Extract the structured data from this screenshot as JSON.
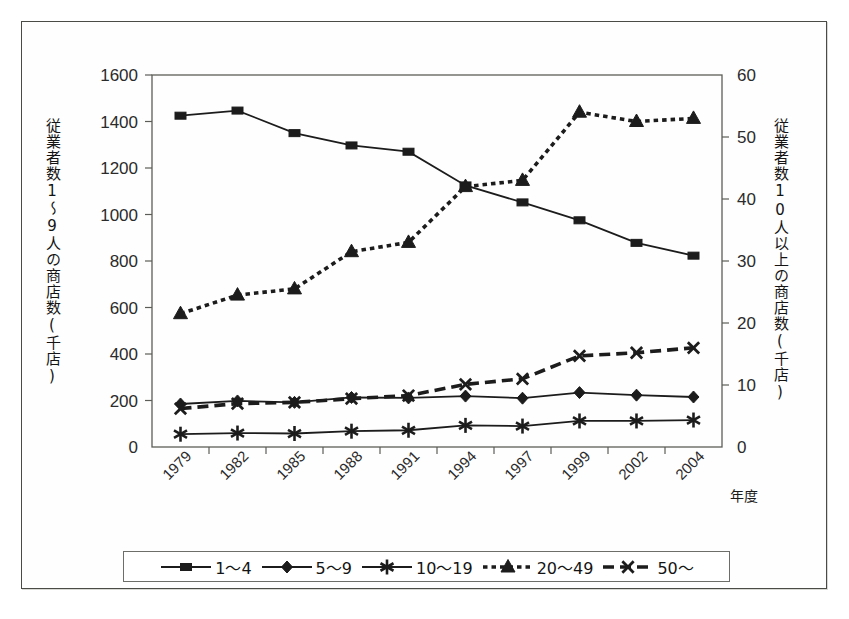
{
  "figure": {
    "left_axis_caption": "従業者数1〜9人の商店数(千店)",
    "right_axis_caption": "従業者数10人以上の商店数(千店)",
    "x_axis_unit_label": "年度"
  },
  "legend": {
    "items": [
      {
        "label": "1〜4",
        "marker": "square-marker",
        "dash": "solid"
      },
      {
        "label": "5〜9",
        "marker": "diamond-marker",
        "dash": "solid"
      },
      {
        "label": "10〜19",
        "marker": "asterisk-marker",
        "dash": "solid"
      },
      {
        "label": "20〜49",
        "marker": "triangle-marker",
        "dash": "dotted"
      },
      {
        "label": "50〜",
        "marker": "star-x-marker",
        "dash": "dashed"
      }
    ]
  },
  "chart_data": {
    "type": "line",
    "title": "",
    "xlabel": "年度",
    "ylabel": "従業者数1〜9人の商店数(千店)",
    "y2label": "従業者数10人以上の商店数(千店)",
    "categories": [
      "1979",
      "1982",
      "1985",
      "1988",
      "1991",
      "1994",
      "1997",
      "1999",
      "2002",
      "2004"
    ],
    "x_tick_labels": [
      "1979",
      "1982",
      "1985",
      "1988",
      "1991",
      "1994",
      "1997",
      "1999",
      "2002",
      "2004"
    ],
    "y_tick_labels": [
      "0",
      "200",
      "400",
      "600",
      "800",
      "1000",
      "1200",
      "1400",
      "1600"
    ],
    "y2_tick_labels": [
      "0",
      "10",
      "20",
      "30",
      "40",
      "50",
      "60"
    ],
    "ylim": [
      0,
      1600
    ],
    "y2lim": [
      0,
      60
    ],
    "grid": false,
    "legend_position": "bottom",
    "series": [
      {
        "name": "1〜4",
        "axis": "left",
        "values": [
          1425,
          1447,
          1350,
          1297,
          1270,
          1125,
          1052,
          975,
          878,
          823
        ]
      },
      {
        "name": "5〜9",
        "axis": "left",
        "values": [
          185,
          198,
          192,
          213,
          211,
          219,
          210,
          234,
          223,
          215
        ]
      },
      {
        "name": "10〜19",
        "axis": "left",
        "values": [
          55,
          60,
          58,
          68,
          72,
          93,
          90,
          112,
          112,
          116
        ]
      },
      {
        "name": "20〜49",
        "axis": "right",
        "values": [
          21.5,
          24.5,
          25.5,
          31.5,
          33,
          42,
          43,
          54,
          52.5,
          53
        ]
      },
      {
        "name": "50〜",
        "axis": "right",
        "values": [
          6.2,
          7.0,
          7.2,
          7.8,
          8.3,
          10.1,
          11.0,
          14.7,
          15.2,
          16.0
        ]
      }
    ]
  },
  "colors": {
    "ink": "#1c1c1c",
    "axis": "#5c5c58",
    "frame": "#4a4a46",
    "page": "#ffffff"
  }
}
